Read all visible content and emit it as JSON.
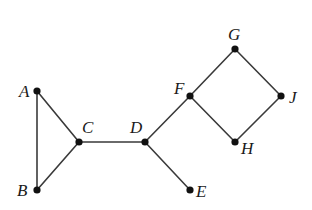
{
  "diagram": {
    "type": "undirected-graph",
    "colors": {
      "edge": "#3a3a3a",
      "node": "#111111",
      "label": "#1a1a1a",
      "background": "#ffffff"
    },
    "nodes": [
      {
        "id": "A",
        "label": "A",
        "x": 37,
        "y": 91,
        "label_x": 19,
        "label_y": 97
      },
      {
        "id": "B",
        "label": "B",
        "x": 37,
        "y": 190,
        "label_x": 17,
        "label_y": 196
      },
      {
        "id": "C",
        "label": "C",
        "x": 79,
        "y": 142,
        "label_x": 82,
        "label_y": 133
      },
      {
        "id": "D",
        "label": "D",
        "x": 145,
        "y": 142,
        "label_x": 130,
        "label_y": 133
      },
      {
        "id": "E",
        "label": "E",
        "x": 190,
        "y": 190,
        "label_x": 196,
        "label_y": 197
      },
      {
        "id": "F",
        "label": "F",
        "x": 190,
        "y": 96,
        "label_x": 174,
        "label_y": 94
      },
      {
        "id": "G",
        "label": "G",
        "x": 235,
        "y": 49,
        "label_x": 228,
        "label_y": 40
      },
      {
        "id": "J",
        "label": "J",
        "x": 281,
        "y": 96,
        "label_x": 289,
        "label_y": 103
      },
      {
        "id": "H",
        "label": "H",
        "x": 235,
        "y": 142,
        "label_x": 241,
        "label_y": 154
      }
    ],
    "edges": [
      {
        "from": "A",
        "to": "B"
      },
      {
        "from": "A",
        "to": "C"
      },
      {
        "from": "B",
        "to": "C"
      },
      {
        "from": "C",
        "to": "D"
      },
      {
        "from": "D",
        "to": "E"
      },
      {
        "from": "D",
        "to": "F"
      },
      {
        "from": "F",
        "to": "G"
      },
      {
        "from": "G",
        "to": "J"
      },
      {
        "from": "J",
        "to": "H"
      },
      {
        "from": "H",
        "to": "F"
      }
    ]
  }
}
